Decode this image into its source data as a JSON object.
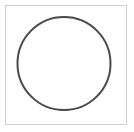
{
  "canvas": {
    "width": 134,
    "height": 132,
    "background_color": "#ffffff"
  },
  "frame": {
    "name": "thumbnail-border",
    "x": 5,
    "y": 5,
    "width": 122,
    "height": 120,
    "stroke_color": "#cfcfcf",
    "stroke_width": 1,
    "fill_color": "#ffffff"
  },
  "shape": {
    "type": "circle",
    "label": "circle-outline",
    "center_x": 64,
    "center_y": 63.5,
    "radius": 46.5,
    "stroke_color": "#4a4a4a",
    "stroke_width": 2,
    "fill": "none"
  }
}
